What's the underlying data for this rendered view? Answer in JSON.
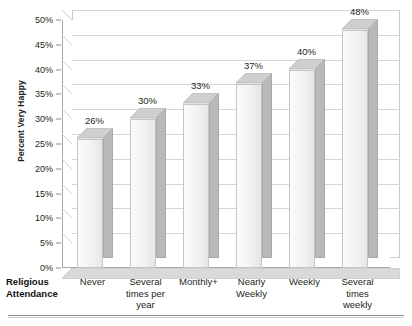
{
  "chart_data": {
    "type": "bar",
    "title": "",
    "xlabel": "Religious Attendance",
    "ylabel": "Percent Very Happy",
    "categories": [
      "Never",
      "Several times per year",
      "Monthly+",
      "Nearly Weekly",
      "Weekly",
      "Several times weekly"
    ],
    "values": [
      26,
      30,
      33,
      37,
      40,
      48
    ],
    "data_labels": [
      "26%",
      "30%",
      "33%",
      "37%",
      "40%",
      "48%"
    ],
    "ylim": [
      0,
      50
    ],
    "ytick_values": [
      0,
      5,
      10,
      15,
      20,
      25,
      30,
      35,
      40,
      45,
      50
    ],
    "ytick_labels": [
      "0%",
      "5%",
      "10%",
      "15%",
      "20%",
      "25%",
      "30%",
      "35%",
      "40%",
      "45%",
      "50%"
    ],
    "grid": true,
    "legend": "none",
    "style": "3d-column",
    "colors": {
      "bar_face": "#f2f2f2",
      "bar_side": "#b9b9b9",
      "bar_top": "#cfcfcf",
      "gridline": "#d6d6d6",
      "axis": "#a9a9a9",
      "text": "#231f20",
      "background": "#ffffff"
    }
  },
  "axis": {
    "y_title": "Percent Very Happy",
    "x_title_line1": "Religious",
    "x_title_line2": "Attendance"
  },
  "category_labels": [
    {
      "line1": "Never",
      "line2": "",
      "line3": ""
    },
    {
      "line1": "Several",
      "line2": "times per",
      "line3": "year"
    },
    {
      "line1": "Monthly+",
      "line2": "",
      "line3": ""
    },
    {
      "line1": "Nearly",
      "line2": "Weekly",
      "line3": ""
    },
    {
      "line1": "Weekly",
      "line2": "",
      "line3": ""
    },
    {
      "line1": "Several",
      "line2": "times",
      "line3": "weekly"
    }
  ]
}
